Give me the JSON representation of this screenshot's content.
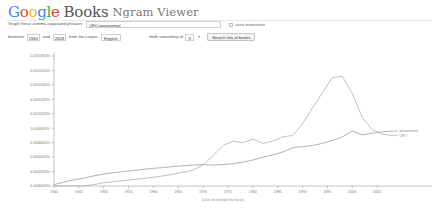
{
  "header": {
    "logo_letters": [
      "G",
      "o",
      "o",
      "g",
      "l",
      "e"
    ],
    "books_word": "Books",
    "product_name": "Ngram Viewer"
  },
  "form": {
    "phrases_label": "Graph these comma-separated phrases:",
    "phrases_value": "UFO,paranormal",
    "phrases_placeholder": "",
    "case_insensitive_label": "case-insensitive",
    "case_insensitive_checked": false,
    "between_label": "between",
    "year_start": "1940",
    "and_label": "and",
    "year_end": "2008",
    "corpus_label": "from the corpus",
    "corpus_value": "English",
    "smoothing_label": "with smoothing of",
    "smoothing_value": "3",
    "search_button_label": "Search lots of books"
  },
  "colors": {
    "series_ufo": "#9aa7b8",
    "series_paranormal": "#8f8f8f",
    "axis": "#9a9a9a",
    "label": "#777777",
    "google_blue": "#4285F4",
    "google_red": "#EA4335",
    "google_yellow": "#FBBC05",
    "google_green": "#34A853"
  },
  "chart_data": {
    "type": "line",
    "title": "",
    "xlabel": "",
    "ylabel": "",
    "caption": "(click on line/label for focus)",
    "grid": false,
    "legend": "right-inline",
    "xlim": [
      1940,
      2008
    ],
    "ylim": [
      0.0,
      0.00018
    ],
    "xticks": [
      1940,
      1945,
      1950,
      1955,
      1960,
      1965,
      1970,
      1975,
      1980,
      1985,
      1990,
      1995,
      2000,
      2005
    ],
    "ytick_labels": [
      "0.0001800%",
      "0.0001600%",
      "0.0001400%",
      "0.0001200%",
      "0.0001000%",
      "0.0000800%",
      "0.0000600%",
      "0.0000400%",
      "0.0000200%",
      "0.0000000%"
    ],
    "ytick_values": [
      0.00018,
      0.00016,
      0.00014,
      0.00012,
      0.0001,
      8e-05,
      6e-05,
      4e-05,
      2e-05,
      0.0
    ],
    "x": [
      1940,
      1942,
      1944,
      1946,
      1948,
      1950,
      1952,
      1954,
      1956,
      1958,
      1960,
      1962,
      1964,
      1966,
      1968,
      1970,
      1972,
      1974,
      1976,
      1978,
      1980,
      1982,
      1984,
      1986,
      1988,
      1990,
      1992,
      1994,
      1996,
      1998,
      2000,
      2002,
      2004,
      2006,
      2008
    ],
    "series": [
      {
        "name": "UFO",
        "color": "#9aa7b8",
        "label_x": 2008,
        "values": [
          0.0,
          0.0,
          1e-07,
          2e-07,
          2e-06,
          4.5e-06,
          6e-06,
          7.5e-06,
          9e-06,
          1.05e-05,
          1.2e-05,
          1.4e-05,
          1.65e-05,
          1.9e-05,
          2.2e-05,
          2.9e-05,
          4.2e-05,
          5.6e-05,
          6.2e-05,
          6e-05,
          6.5e-05,
          5.9e-05,
          6.2e-05,
          6.8e-05,
          7e-05,
          8.6e-05,
          0.000108,
          0.000129,
          0.00015,
          0.000152,
          0.000128,
          9.5e-05,
          7.8e-05,
          7.2e-05,
          7e-05
        ]
      },
      {
        "name": "paranormal",
        "color": "#8f8f8f",
        "label_x": 2008,
        "values": [
          2e-06,
          5.5e-06,
          8.5e-06,
          1.1e-05,
          1.4e-05,
          1.65e-05,
          1.85e-05,
          2e-05,
          2.15e-05,
          2.3e-05,
          2.45e-05,
          2.55e-05,
          2.7e-05,
          2.8e-05,
          2.9e-05,
          2.95e-05,
          2.9e-05,
          2.95e-05,
          3.1e-05,
          3.3e-05,
          3.6e-05,
          4e-05,
          4.3e-05,
          4.7e-05,
          5.3e-05,
          5.45e-05,
          5.6e-05,
          5.9e-05,
          6.3e-05,
          6.8e-05,
          7.6e-05,
          7.1e-05,
          7.3e-05,
          7.5e-05,
          7.6e-05
        ]
      }
    ]
  }
}
